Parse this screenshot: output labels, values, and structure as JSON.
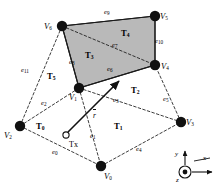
{
  "figure": {
    "type": "3d-mesh-triangulation-diagram",
    "background": "#ffffff",
    "stroke_color": "#1a1a1a",
    "shaded_face_fill": "#b9b9b9"
  },
  "vertices": [
    {
      "id": "V0",
      "name": "V",
      "sub": "0",
      "x": 101,
      "y": 166,
      "label_x": 104,
      "label_y": 174
    },
    {
      "id": "V1",
      "name": "V",
      "sub": "1",
      "x": 79,
      "y": 88,
      "label_x": 70,
      "label_y": 96
    },
    {
      "id": "V2",
      "name": "V",
      "sub": "2",
      "x": 20,
      "y": 126,
      "label_x": 6,
      "label_y": 136
    },
    {
      "id": "V3",
      "name": "V",
      "sub": "3",
      "x": 181,
      "y": 122,
      "label_x": 186,
      "label_y": 130
    },
    {
      "id": "V4",
      "name": "V",
      "sub": "4",
      "x": 155,
      "y": 65,
      "label_x": 159,
      "label_y": 73
    },
    {
      "id": "V5",
      "name": "V",
      "sub": "5",
      "x": 155,
      "y": 16,
      "label_x": 160,
      "label_y": 22
    },
    {
      "id": "V6",
      "name": "V",
      "sub": "6",
      "x": 62,
      "y": 26,
      "label_x": 44,
      "label_y": 30
    }
  ],
  "faces": [
    {
      "id": "T0",
      "name": "T",
      "sub": "0",
      "label_x": 41,
      "label_y": 127
    },
    {
      "id": "T1",
      "name": "T",
      "sub": "1",
      "label_x": 117,
      "label_y": 127
    },
    {
      "id": "T2",
      "name": "T",
      "sub": "2",
      "label_x": 133,
      "label_y": 91
    },
    {
      "id": "T3",
      "name": "T",
      "sub": "3",
      "label_x": 88,
      "label_y": 56
    },
    {
      "id": "T4",
      "name": "T",
      "sub": "4",
      "label_x": 124,
      "label_y": 34
    },
    {
      "id": "T5",
      "name": "T",
      "sub": "5",
      "label_x": 50,
      "label_y": 77
    }
  ],
  "edges": [
    {
      "id": "e0",
      "name": "e",
      "sub": "0",
      "label_x": 55,
      "label_y": 153
    },
    {
      "id": "e1",
      "name": "e",
      "sub": "1",
      "label_x": 92,
      "label_y": 137
    },
    {
      "id": "e2",
      "name": "e",
      "sub": "2",
      "label_x": 44,
      "label_y": 104
    },
    {
      "id": "e3",
      "name": "e",
      "sub": "3",
      "label_x": 116,
      "label_y": 101
    },
    {
      "id": "e4",
      "name": "e",
      "sub": "4",
      "label_x": 139,
      "label_y": 150
    },
    {
      "id": "e5",
      "name": "e",
      "sub": "5",
      "label_x": 165,
      "label_y": 100
    },
    {
      "id": "e6",
      "name": "e",
      "sub": "6",
      "label_x": 110,
      "label_y": 70
    },
    {
      "id": "e7",
      "name": "e",
      "sub": "7",
      "label_x": 115,
      "label_y": 46
    },
    {
      "id": "e8",
      "name": "e",
      "sub": "8",
      "label_x": 72,
      "label_y": 63
    },
    {
      "id": "e9",
      "name": "e",
      "sub": "9",
      "label_x": 107,
      "label_y": 13
    },
    {
      "id": "e10",
      "name": "e",
      "sub": "10",
      "label_x": 158,
      "label_y": 42
    },
    {
      "id": "e11",
      "name": "e",
      "sub": "11",
      "label_x": 24,
      "label_y": 71
    }
  ],
  "annotations": {
    "sample_point_label": "Tx",
    "sample_point_label_x": 71,
    "sample_point_label_y": 147,
    "sample_point_cx": 66,
    "sample_point_cy": 135,
    "ray_label": "r",
    "ray_label_x": 95,
    "ray_label_y": 118,
    "ray_from_x": 68,
    "ray_from_y": 132,
    "ray_to_x": 121,
    "ray_to_y": 79
  },
  "axes": {
    "origin_x": 185,
    "origin_y": 172,
    "x_label": "x",
    "y_label": "y",
    "z_label": "z",
    "x_label_x": 204,
    "x_label_y": 160,
    "y_label_x": 176,
    "y_label_y": 156,
    "z_label_x": 177,
    "z_label_y": 183
  }
}
